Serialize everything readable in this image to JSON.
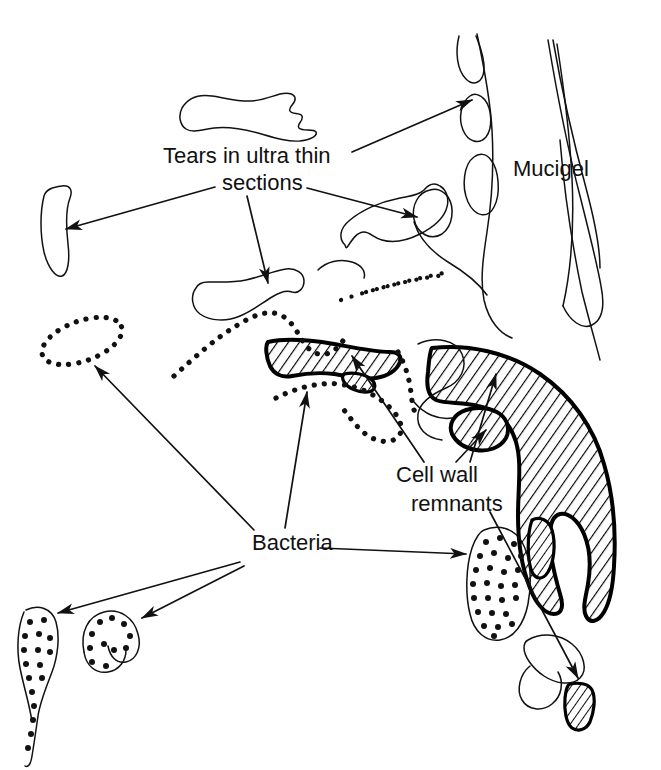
{
  "figure": {
    "type": "scientific-line-drawing",
    "background_color": "#ffffff",
    "ink_color": "#111111",
    "width": 661,
    "height": 770
  },
  "labels": {
    "tears": {
      "line1": "Tears in ultra thin",
      "line2": "sections",
      "x1": 163,
      "y1": 163,
      "x2": 222,
      "y2": 190,
      "arrow_count": 4
    },
    "mucigel": {
      "text": "Mucigel",
      "x": 513,
      "y": 176,
      "arrow_count": 0
    },
    "cell_wall": {
      "line1": "Cell  wall",
      "line2": "remnants",
      "x1": 396,
      "y1": 482,
      "x2": 411,
      "y2": 511,
      "arrow_count": 3
    },
    "bacteria": {
      "text": "Bacteria",
      "x": 252,
      "y": 550,
      "arrow_count": 5
    }
  },
  "features": {
    "mucigel_voids": 3,
    "hatched_remnants": 5,
    "dotted_bacteria": 7,
    "tear_outlines": 5,
    "dotted_line_fragments": 2
  },
  "legend_keys": [
    {
      "name": "mucigel",
      "style": "thin continuous outline"
    },
    {
      "name": "cell-wall-remnant",
      "style": "thick outline with diagonal hatching"
    },
    {
      "name": "bacteria",
      "style": "thin outline with black dot stipple"
    },
    {
      "name": "tear",
      "style": "thin irregular closed outline, unfilled"
    }
  ]
}
